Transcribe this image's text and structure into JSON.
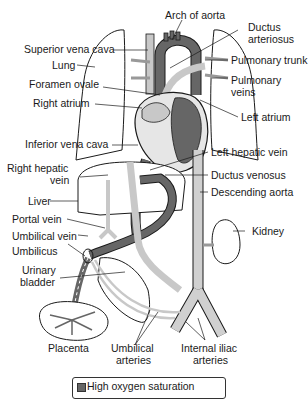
{
  "labels": {
    "arch_of_aorta": "Arch of aorta",
    "ductus_arteriosus_1": "Ductus",
    "ductus_arteriosus_2": "arteriosus",
    "superior_vena_cava": "Superior vena cava",
    "pulmonary_trunk": "Pulmonary trunk",
    "lung": "Lung",
    "pulmonary_veins_1": "Pulmonary",
    "pulmonary_veins_2": "veins",
    "foramen_ovale": "Foramen ovale",
    "right_atrium": "Right atrium",
    "left_atrium": "Left atrium",
    "inferior_vena_cava": "Inferior vena cava",
    "left_hepatic_vein": "Left hepatic vein",
    "right_hepatic_vein_1": "Right hepatic",
    "right_hepatic_vein_2": "vein",
    "ductus_venosus": "Ductus venosus",
    "liver": "Liver",
    "descending_aorta": "Descending aorta",
    "portal_vein": "Portal vein",
    "kidney": "Kidney",
    "umbilical_vein": "Umbilical vein",
    "umbilicus": "Umbilicus",
    "urinary_bladder_1": "Urinary",
    "urinary_bladder_2": "bladder",
    "placenta": "Placenta",
    "umbilical_arteries_1": "Umbilical",
    "umbilical_arteries_2": "arteries",
    "internal_iliac_arteries_1": "Internal iliac",
    "internal_iliac_arteries_2": "arteries"
  },
  "legend": {
    "items": [
      {
        "label": "High oxygen saturation",
        "color": "#666666"
      }
    ]
  },
  "colors": {
    "high_oxygen": "#666666",
    "medium_oxygen": "#c8c8c8",
    "low_oxygen": "#e6e6e6",
    "outline": "#1a1a1a"
  }
}
